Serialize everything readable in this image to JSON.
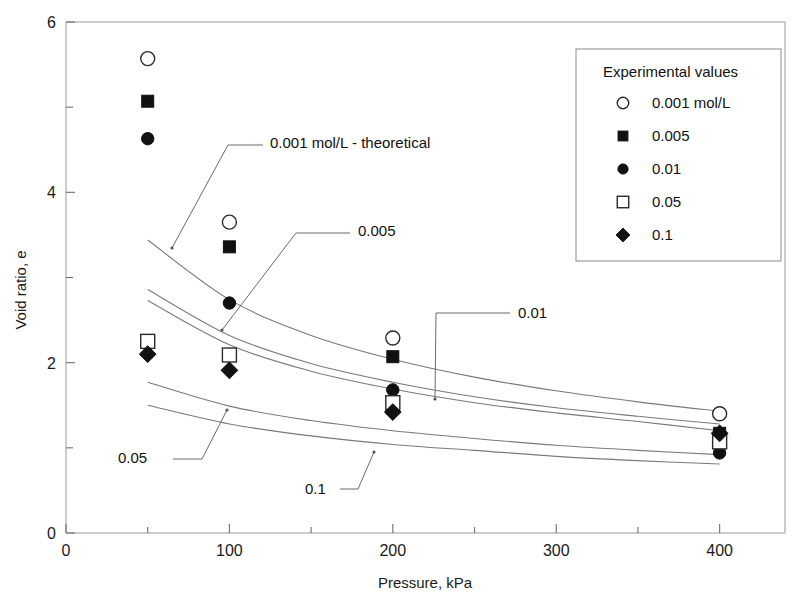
{
  "chart_data": {
    "type": "scatter",
    "title": "",
    "xlabel": "Pressure, kPa",
    "ylabel": "Void ratio, e",
    "xlim": [
      0,
      440
    ],
    "ylim": [
      0,
      6
    ],
    "xticks": [
      0,
      100,
      200,
      300,
      400
    ],
    "xticklabels": [
      "0",
      "100",
      "200",
      "300",
      "400"
    ],
    "xminorticks": [
      50,
      150,
      250,
      350
    ],
    "yticks": [
      0,
      2,
      4,
      6
    ],
    "yticklabels": [
      "0",
      "2",
      "4",
      "6"
    ],
    "yminorticks": [
      1,
      3,
      5
    ],
    "grid": false,
    "legend_position": "top-right",
    "x": [
      50,
      100,
      200,
      400
    ],
    "series": [
      {
        "name": "0.001 mol/L",
        "marker": "open-circle",
        "values": [
          5.57,
          3.65,
          2.29,
          1.4
        ]
      },
      {
        "name": "0.005",
        "marker": "filled-square",
        "values": [
          5.07,
          3.36,
          2.07,
          1.17
        ]
      },
      {
        "name": "0.01",
        "marker": "filled-circle",
        "values": [
          4.63,
          2.7,
          1.68,
          0.94
        ]
      },
      {
        "name": "0.05",
        "marker": "open-square",
        "values": [
          2.25,
          2.09,
          1.53,
          1.07
        ]
      },
      {
        "name": "0.1",
        "marker": "filled-diamond",
        "values": [
          2.1,
          1.91,
          1.42,
          1.17
        ]
      }
    ],
    "theoretical_curves": [
      {
        "name": "0.001 mol/L - theoretical",
        "x": [
          50,
          100,
          150,
          200,
          250,
          300,
          350,
          400
        ],
        "values": [
          3.44,
          2.74,
          2.32,
          2.04,
          1.83,
          1.67,
          1.54,
          1.43
        ]
      },
      {
        "name": "0.005",
        "x": [
          50,
          100,
          150,
          200,
          250,
          300,
          350,
          400
        ],
        "values": [
          2.86,
          2.32,
          1.99,
          1.77,
          1.6,
          1.47,
          1.37,
          1.28
        ]
      },
      {
        "name": "0.01",
        "x": [
          50,
          100,
          150,
          200,
          250,
          300,
          350,
          400
        ],
        "values": [
          2.73,
          2.21,
          1.9,
          1.69,
          1.53,
          1.41,
          1.31,
          1.2
        ]
      },
      {
        "name": "0.05",
        "x": [
          50,
          100,
          150,
          200,
          250,
          300,
          350,
          400
        ],
        "values": [
          1.77,
          1.49,
          1.32,
          1.2,
          1.11,
          1.03,
          0.97,
          0.92
        ]
      },
      {
        "name": "0.1",
        "x": [
          50,
          100,
          150,
          200,
          250,
          300,
          350,
          400
        ],
        "values": [
          1.5,
          1.28,
          1.14,
          1.04,
          0.97,
          0.9,
          0.85,
          0.81
        ]
      }
    ],
    "annotations": [
      {
        "label": "0.001 mol/L - theoretical",
        "text_x": 270,
        "text_y": 148
      },
      {
        "label": "0.005",
        "text_x": 358,
        "text_y": 236
      },
      {
        "label": "0.01",
        "text_x": 518,
        "text_y": 318
      },
      {
        "label": "0.05",
        "text_x": 118,
        "text_y": 463
      },
      {
        "label": "0.1",
        "text_x": 305,
        "text_y": 494
      }
    ]
  },
  "legend": {
    "title": "Experimental values",
    "items": [
      {
        "label": "0.001 mol/L",
        "marker": "open-circle"
      },
      {
        "label": "0.005",
        "marker": "filled-square"
      },
      {
        "label": "0.01",
        "marker": "filled-circle"
      },
      {
        "label": "0.05",
        "marker": "open-square"
      },
      {
        "label": "0.1",
        "marker": "filled-diamond"
      }
    ]
  },
  "axes": {
    "x_title": "Pressure, kPa",
    "y_title": "Void ratio, e",
    "x_labels": [
      "0",
      "100",
      "200",
      "300",
      "400"
    ],
    "y_labels": [
      "0",
      "2",
      "4",
      "6"
    ]
  },
  "colors": {
    "ink": "#111111",
    "axis": "#9a9a9a",
    "curve": "#7a7a7a",
    "background": "#ffffff"
  }
}
